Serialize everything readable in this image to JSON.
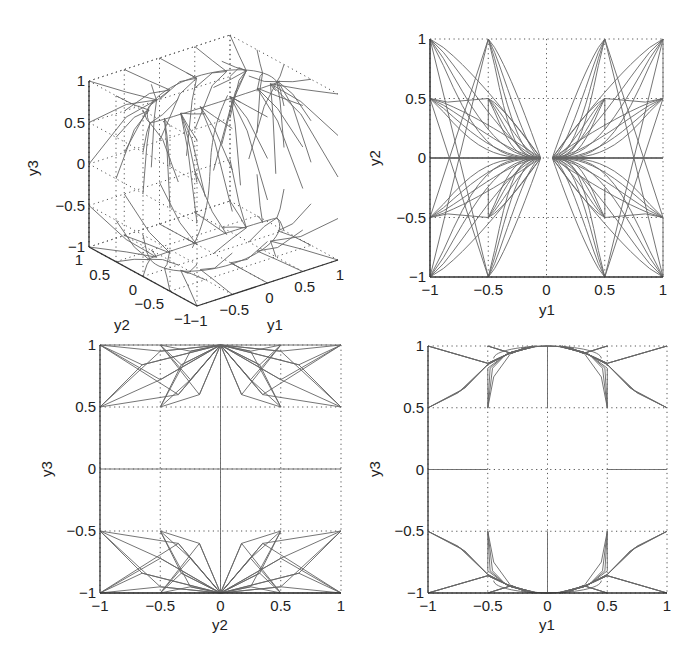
{
  "chart_data": [
    {
      "id": "plot3d",
      "type": "line3d",
      "title": "",
      "xlabel": "y1",
      "ylabel": "y2",
      "zlabel": "y3",
      "xticks": [
        "-1",
        "-0.5",
        "0",
        "0.5",
        "1"
      ],
      "yticks": [
        "-1",
        "-0.5",
        "0",
        "0.5",
        "1"
      ],
      "zticks": [
        "-1",
        "-0.5",
        "0",
        "0.5",
        "1"
      ],
      "xlim": [
        -1,
        1
      ],
      "ylim": [
        -1,
        1
      ],
      "zlim": [
        -1,
        1
      ],
      "grid": true,
      "description": "Trajectories from grid points on the cube [-1,1]^3 converging to the unit circle arcs near y3=+1 and y3=-1"
    },
    {
      "id": "plot_y1_y2",
      "type": "line",
      "title": "",
      "xlabel": "y1",
      "ylabel": "y2",
      "xticks": [
        "-1",
        "-0.5",
        "0",
        "0.5",
        "1"
      ],
      "yticks": [
        "-1",
        "-0.5",
        "0",
        "0.5",
        "1"
      ],
      "xlim": [
        -1,
        1
      ],
      "ylim": [
        -1,
        1
      ],
      "grid": true,
      "description": "Projection onto y1-y2 plane; trajectories from |y1|∈{0.5,1} corners converge toward (±0.05, 0)"
    },
    {
      "id": "plot_y2_y3",
      "type": "line",
      "title": "",
      "xlabel": "y2",
      "ylabel": "y3",
      "xticks": [
        "-1",
        "-0.5",
        "0",
        "0.5",
        "1"
      ],
      "yticks": [
        "-1",
        "-0.5",
        "0",
        "0.5",
        "1"
      ],
      "xlim": [
        -1,
        1
      ],
      "ylim": [
        -1,
        1
      ],
      "grid": true,
      "description": "Projection onto y2-y3 plane; trajectories converge to (0, ±1)"
    },
    {
      "id": "plot_y1_y3",
      "type": "line",
      "title": "",
      "xlabel": "y1",
      "ylabel": "y3",
      "xticks": [
        "-1",
        "-0.5",
        "0",
        "0.5",
        "1"
      ],
      "yticks": [
        "-1",
        "-0.5",
        "0",
        "0.5",
        "1"
      ],
      "xlim": [
        -1,
        1
      ],
      "ylim": [
        -1,
        1
      ],
      "grid": true,
      "description": "Projection onto y1-y3 plane; trajectories converge onto unit circle arcs near y3=±1"
    }
  ],
  "panels": {
    "p3d": {
      "xlabel": "y1",
      "ylabel": "y2",
      "zlabel": "y3"
    },
    "tr": {
      "xlabel": "y1",
      "ylabel": "y2"
    },
    "bl": {
      "xlabel": "y2",
      "ylabel": "y3"
    },
    "br": {
      "xlabel": "y1",
      "ylabel": "y3"
    }
  },
  "ticks": [
    "-1",
    "-0.5",
    "0",
    "0.5",
    "1"
  ],
  "colors": {
    "line": "#666666",
    "axis": "#333333",
    "text": "#222222"
  }
}
